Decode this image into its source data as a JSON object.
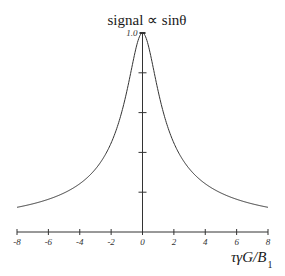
{
  "chart_data": {
    "type": "line",
    "title": "signal ∝ sinθ",
    "xlabel": "τγG/B",
    "xlabel_subscript": "1",
    "ylabel": "",
    "xlim": [
      -8,
      8
    ],
    "ylim": [
      0,
      1.0
    ],
    "x_ticks": [
      -8,
      -6,
      -4,
      -2,
      0,
      2,
      4,
      6,
      8
    ],
    "x_tick_labels": [
      "-8",
      "-6",
      "-4",
      "-2",
      "0",
      "2",
      "4",
      "6",
      "8"
    ],
    "y_ticks": [
      0.2,
      0.4,
      0.6,
      0.8,
      1.0
    ],
    "y_tick_labels": [
      "1.0"
    ],
    "grid": false,
    "legend": null,
    "series": [
      {
        "name": "signal",
        "function": "1/sqrt(1+x^2)",
        "x": [
          -8,
          -7,
          -6,
          -5,
          -4,
          -3,
          -2.5,
          -2,
          -1.5,
          -1,
          -0.75,
          -0.5,
          -0.25,
          0,
          0.25,
          0.5,
          0.75,
          1,
          1.5,
          2,
          2.5,
          3,
          4,
          5,
          6,
          7,
          8
        ],
        "y": [
          0.124,
          0.141,
          0.164,
          0.196,
          0.243,
          0.316,
          0.371,
          0.447,
          0.555,
          0.707,
          0.8,
          0.894,
          0.97,
          1.0,
          0.97,
          0.894,
          0.8,
          0.707,
          0.555,
          0.447,
          0.371,
          0.316,
          0.243,
          0.196,
          0.164,
          0.141,
          0.124
        ]
      }
    ]
  },
  "colors": {
    "line": "#333333",
    "axis": "#333333",
    "background": "#ffffff"
  }
}
